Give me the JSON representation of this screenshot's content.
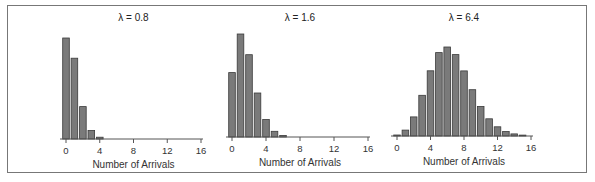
{
  "chart_data": [
    {
      "type": "bar",
      "title": "λ = 0.8",
      "xlabel": "Number of Arrivals",
      "ylabel": "",
      "x_ticks": [
        "0",
        "4",
        "8",
        "12",
        "16"
      ],
      "xlim": [
        0,
        16
      ],
      "categories": [
        0,
        1,
        2,
        3,
        4
      ],
      "values": [
        0.449,
        0.359,
        0.144,
        0.038,
        0.008
      ],
      "ylim": [
        0,
        0.449
      ]
    },
    {
      "type": "bar",
      "title": "λ = 1.6",
      "xlabel": "Number of Arrivals",
      "ylabel": "",
      "x_ticks": [
        "0",
        "4",
        "8",
        "12",
        "16"
      ],
      "xlim": [
        0,
        16
      ],
      "categories": [
        0,
        1,
        2,
        3,
        4,
        5,
        6
      ],
      "values": [
        0.202,
        0.323,
        0.258,
        0.138,
        0.055,
        0.018,
        0.005
      ],
      "ylim": [
        0,
        0.323
      ]
    },
    {
      "type": "bar",
      "title": "λ = 6.4",
      "xlabel": "Number of Arrivals",
      "ylabel": "",
      "x_ticks": [
        "0",
        "4",
        "8",
        "12",
        "16"
      ],
      "xlim": [
        0,
        16
      ],
      "categories": [
        0,
        1,
        2,
        3,
        4,
        5,
        6,
        7,
        8,
        9,
        10,
        11,
        12,
        13,
        14,
        15
      ],
      "values": [
        0.0017,
        0.0106,
        0.034,
        0.0726,
        0.1162,
        0.1487,
        0.1586,
        0.145,
        0.116,
        0.0825,
        0.0528,
        0.0307,
        0.0164,
        0.0081,
        0.0037,
        0.0016
      ],
      "ylim": [
        0,
        0.1586
      ]
    }
  ],
  "colors": {
    "bar_fill": "#7a7a7a",
    "bar_stroke": "#3a3a3a",
    "axis": "#555555",
    "frame": "#777777"
  }
}
